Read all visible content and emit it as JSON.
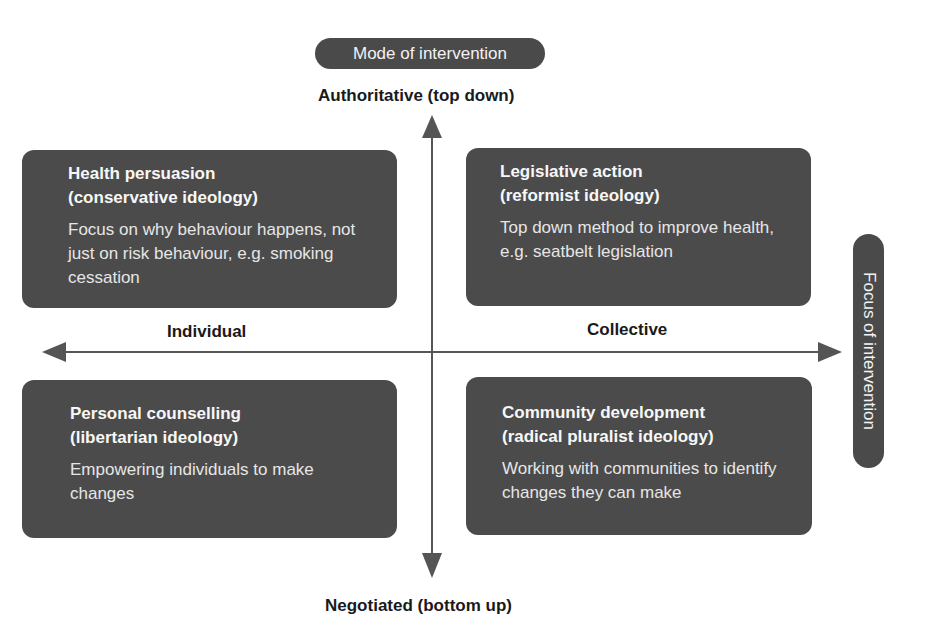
{
  "vertical_axis": {
    "pill_label": "Mode of intervention",
    "top_label": "Authoritative (top down)",
    "bottom_label": "Negotiated (bottom up)"
  },
  "horizontal_axis": {
    "pill_label": "Focus of intervention",
    "left_label": "Individual",
    "right_label": "Collective"
  },
  "quadrants": [
    {
      "position": "top-left",
      "title_line1": "Health persuasion",
      "title_line2": "(conservative ideology)",
      "description": "Focus on why behaviour happens, not just on risk behaviour, e.g. smoking cessation"
    },
    {
      "position": "top-right",
      "title_line1": "Legislative action",
      "title_line2": "(reformist ideology)",
      "description": "Top down method to improve health, e.g. seatbelt legislation"
    },
    {
      "position": "bottom-left",
      "title_line1": "Personal counselling",
      "title_line2": "(libertarian ideology)",
      "description": "Empowering individuals to make changes"
    },
    {
      "position": "bottom-right",
      "title_line1": "Community development",
      "title_line2": "(radical pluralist ideology)",
      "description": "Working with communities to identify changes they can make"
    }
  ],
  "colors": {
    "box_fill": "#4b4b4b",
    "arrow": "#555555",
    "background": "#ffffff"
  }
}
